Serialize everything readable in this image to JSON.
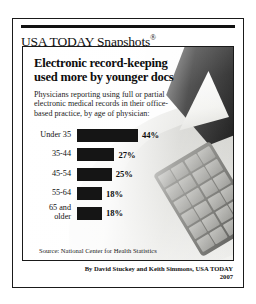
{
  "masthead": {
    "brand": "USA TODAY Snapshots",
    "registered_mark": "®"
  },
  "chart_data": {
    "type": "bar",
    "orientation": "horizontal",
    "title": "Electronic record-keeping used more by younger docs",
    "subtitle": "Physicians reporting using full or partial electronic medical records in their office-based practice, by age of physician:",
    "categories": [
      "Under 35",
      "35-44",
      "45-54",
      "55-64",
      "65 and older"
    ],
    "values": [
      44,
      27,
      25,
      18,
      18
    ],
    "value_labels": [
      "44%",
      "27%",
      "25%",
      "18%",
      "18%"
    ],
    "xlabel": "",
    "ylabel": "",
    "xlim": [
      0,
      44
    ],
    "grid": false,
    "legend": null,
    "bar_color": "#151515",
    "source": "Source: National Center for Health Statistics"
  },
  "byline": {
    "credit": "By David Stuckey and Keith Simmons, USA TODAY",
    "year": "2007"
  },
  "artwork": {
    "monitor": "computer-monitor-illustration",
    "keypad": "computer-keypad-illustration"
  }
}
